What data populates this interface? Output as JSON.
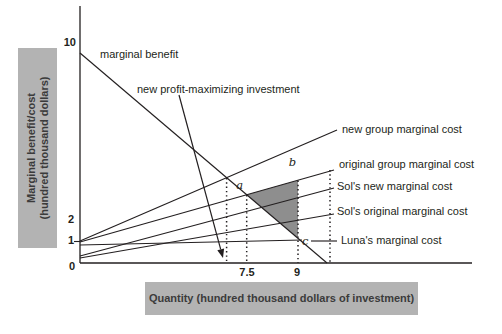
{
  "y_axis_box": {
    "line1": "Marginal benefit/cost",
    "line2": "(hundred thousand dollars)"
  },
  "x_axis_box": {
    "label": "Quantity (hundred thousand dollars of investment)"
  },
  "colors": {
    "line": "#231f20",
    "box_bg": "#b3b3b3",
    "box_text": "#3b3b3b",
    "shade": "#8e8e8e"
  },
  "chart_data": {
    "type": "line",
    "title": "",
    "xlabel": "Quantity (hundred thousand dollars of investment)",
    "ylabel": "Marginal benefit/cost (hundred thousand dollars)",
    "x_tick_values": [
      0,
      7.5,
      9
    ],
    "y_tick_values": [
      0,
      1,
      2,
      10
    ],
    "grid": false,
    "legend": "inline labels with leader lines",
    "series": [
      {
        "name": "marginal benefit",
        "points": [
          [
            0,
            9.6
          ],
          [
            10.3,
            0
          ]
        ]
      },
      {
        "name": "new group marginal cost",
        "points": [
          [
            0,
            1
          ],
          [
            10.5,
            6
          ]
        ]
      },
      {
        "name": "original group marginal cost",
        "points": [
          [
            0,
            1
          ],
          [
            10.5,
            4.2
          ]
        ]
      },
      {
        "name": "Sol's new marginal cost",
        "points": [
          [
            0,
            0.3
          ],
          [
            10.5,
            3.4
          ]
        ]
      },
      {
        "name": "Sol's original marginal cost",
        "points": [
          [
            0,
            0.2
          ],
          [
            10.5,
            2.2
          ]
        ]
      },
      {
        "name": "Luna's marginal cost",
        "points": [
          [
            0,
            0.85
          ],
          [
            9.2,
            1
          ]
        ]
      }
    ],
    "key_points": [
      {
        "name": "a",
        "meaning": "marginal benefit = original group marginal cost",
        "x": 7.5,
        "y": 2.9
      },
      {
        "name": "b",
        "meaning": "original group marginal cost at quantity 9",
        "x": 9,
        "y": 3.3
      },
      {
        "name": "c",
        "meaning": "marginal benefit at quantity 9",
        "x": 9,
        "y": 1
      },
      {
        "name": "new profit-maximizing investment",
        "meaning": "marginal benefit = new group marginal cost, marked by arrow and dotted line",
        "x": 6.5,
        "y": 3.8
      }
    ],
    "shaded_region": "triangle a-b-c (gray)",
    "annotations": [
      "marginal benefit",
      "new profit-maximizing investment"
    ]
  },
  "render": {
    "axes": {
      "y": {
        "x": 80,
        "y1": 6,
        "y2": 263
      },
      "x": {
        "y": 263,
        "x1": 80,
        "x2": 472
      }
    },
    "y_ticks": [
      {
        "label": "10",
        "tx": 76,
        "ty": 46,
        "mark": false,
        "my": 42
      },
      {
        "label": "2",
        "tx": 74,
        "ty": 223,
        "mark": false,
        "my": 219
      },
      {
        "label": "1",
        "tx": 74,
        "ty": 244,
        "mark": true,
        "my": 241.5
      },
      {
        "label": "0",
        "tx": 75,
        "ty": 270,
        "mark": false,
        "my": 263
      }
    ],
    "x_ticks": [
      {
        "label": "7.5",
        "tx": 247,
        "ty": 276
      },
      {
        "label": "9",
        "tx": 297,
        "ty": 276
      }
    ],
    "triangle": {
      "points": "246.7,194.7 298,180.2 298,238.3"
    },
    "dotted": [
      {
        "x": 226.6,
        "y1": 178,
        "y2": 263
      },
      {
        "x": 246.7,
        "y1": 195,
        "y2": 263
      },
      {
        "x": 298,
        "y1": 180.5,
        "y2": 263
      },
      {
        "x": 330,
        "y1": 170,
        "y2": 263
      }
    ],
    "lines": [
      {
        "name": "marginal-benefit-line",
        "x1": 80,
        "y1": 53,
        "x2": 327,
        "y2": 263
      },
      {
        "name": "new-group-marginal-cost-line",
        "x1": 80,
        "y1": 241,
        "x2": 337,
        "y2": 130
      },
      {
        "name": "original-group-marginal-cost-line",
        "x1": 80,
        "y1": 242,
        "x2": 334,
        "y2": 170
      },
      {
        "name": "sols-new-marginal-cost-line",
        "x1": 80,
        "y1": 256,
        "x2": 334,
        "y2": 188
      },
      {
        "name": "sols-original-marginal-cost-line",
        "x1": 80,
        "y1": 258,
        "x2": 334,
        "y2": 214
      },
      {
        "name": "lunas-marginal-cost-line",
        "x1": 80,
        "y1": 245,
        "x2": 302,
        "y2": 240
      },
      {
        "name": "luna-label-leader-line",
        "x1": 311,
        "y1": 241,
        "x2": 337,
        "y2": 241
      }
    ],
    "line_labels": [
      {
        "name": "marginal-benefit-label",
        "text": "marginal benefit",
        "x": 100,
        "y": 58,
        "anchor": "start"
      },
      {
        "name": "new-group-marginal-cost-label",
        "text": "new group marginal cost",
        "x": 342,
        "y": 133,
        "anchor": "start"
      },
      {
        "name": "original-group-marginal-cost-label",
        "text": "original group marginal cost",
        "x": 339,
        "y": 168,
        "anchor": "start"
      },
      {
        "name": "sols-new-marginal-cost-label",
        "text": "Sol's new marginal cost",
        "x": 337,
        "y": 190,
        "anchor": "start"
      },
      {
        "name": "sols-original-marginal-cost-label",
        "text": "Sol's original marginal cost",
        "x": 337,
        "y": 215,
        "anchor": "start"
      },
      {
        "name": "lunas-marginal-cost-label",
        "text": "Luna's marginal cost",
        "x": 341,
        "y": 244,
        "anchor": "start"
      }
    ],
    "arrow_annotation": {
      "label": "new profit-maximizing investment",
      "label_x": 137,
      "label_y": 93,
      "x1": 179,
      "y1": 95,
      "x2": 220.7,
      "y2": 249.3,
      "head": "223,258 224.1,248.4 217.3,250.2"
    },
    "point_labels": [
      {
        "name": "point-a-label",
        "text": "a",
        "x": 243,
        "y": 189,
        "anchor": "end"
      },
      {
        "name": "point-b-label",
        "text": "b",
        "x": 296,
        "y": 166,
        "anchor": "end"
      },
      {
        "name": "point-c-label",
        "text": "c",
        "x": 302,
        "y": 245,
        "anchor": "start"
      }
    ]
  }
}
